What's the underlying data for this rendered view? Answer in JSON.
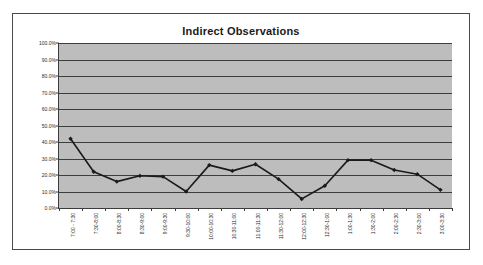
{
  "chart_data": {
    "type": "line",
    "title": "Indirect Observations",
    "xlabel": "",
    "ylabel": "",
    "ylim": [
      0,
      100
    ],
    "grid": true,
    "legend": "none",
    "y_tick_labels": [
      "100.0%",
      "90.0%",
      "80.0%",
      "70.0%",
      "60.0%",
      "50.0%",
      "40.0%",
      "30.0%",
      "20.0%",
      "10.0%",
      "0.0%"
    ],
    "y_tick_values": [
      100,
      90,
      80,
      70,
      60,
      50,
      40,
      30,
      20,
      10,
      0
    ],
    "categories": [
      "7:00 - 7:30",
      "7:30-8:00",
      "8:00-8:30",
      "8:30-9:00",
      "9:00-9:30",
      "9:30-10:00",
      "10:00-10:30",
      "10:30-11:00",
      "11:00-11:30",
      "11:30-12:00",
      "12:00-12:30",
      "12:30-1:00",
      "1:00-1:30",
      "1:30-2:00",
      "2:00-2:30",
      "2:30-3:00",
      "3:00-3:30"
    ],
    "values": [
      42,
      22,
      16,
      19.5,
      19,
      10,
      26,
      22.5,
      26.5,
      17.5,
      5.5,
      13.5,
      29,
      29,
      23,
      20.5,
      11
    ],
    "series_color": "#1a1a1a",
    "plot_background": "#bdbdbd",
    "gridline_color": "#3d3d3d",
    "marker": "diamond"
  }
}
